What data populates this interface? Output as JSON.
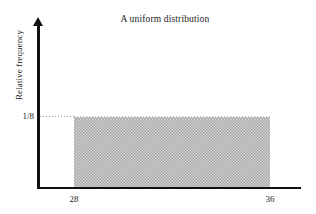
{
  "chart_data": {
    "type": "bar",
    "title": "A uniform distribution",
    "subtitle": "",
    "xlabel": "",
    "ylabel": "Relative frequency",
    "categories": [
      "28 to 36"
    ],
    "values": [
      0.125
    ],
    "x": [
      28,
      36
    ],
    "xlim": [
      26,
      38
    ],
    "ylim": [
      0,
      0.18
    ],
    "xtick_labels": [
      "28",
      "36"
    ],
    "ytick_labels": [
      "1/8"
    ],
    "ytick_values": [
      0.125
    ],
    "grid": false,
    "legend": null,
    "annotations": [],
    "bar_fill_color": "#b4b4b4",
    "axis_color": "#111111",
    "text_color": "#1c1c1c",
    "background_color": "#ffffff",
    "leader_line_style": "dotted"
  },
  "figure": {
    "title": "A uniform distribution",
    "y_axis_label": "Relative frequency",
    "y_tick_1": "1/8",
    "x_tick_left": "28",
    "x_tick_right": "36"
  }
}
